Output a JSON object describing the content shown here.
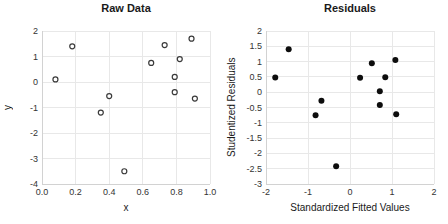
{
  "style": {
    "background": "#ffffff",
    "grid_color": "#e8e8e8",
    "axis_color": "#d2d2d2",
    "tick_color": "#333333",
    "text_color": "#1a1a1a",
    "open_marker_color": "#3a3a3a",
    "filled_marker_color": "#0d0d0d"
  },
  "chart_data": [
    {
      "type": "scatter",
      "title": "Raw Data",
      "xlabel": "x",
      "ylabel": "y",
      "xlim": [
        0.0,
        1.0
      ],
      "ylim": [
        -4,
        2
      ],
      "xticks": [
        "0.0",
        "0.2",
        "0.4",
        "0.6",
        "0.8",
        "1.0"
      ],
      "yticks": [
        "2",
        "1",
        "0",
        "-1",
        "-2",
        "-3",
        "-4"
      ],
      "grid": true,
      "legend": false,
      "marker": "open-circle",
      "points": [
        [
          0.08,
          0.1
        ],
        [
          0.18,
          1.4
        ],
        [
          0.35,
          -1.2
        ],
        [
          0.4,
          -0.55
        ],
        [
          0.49,
          -3.5
        ],
        [
          0.65,
          0.75
        ],
        [
          0.73,
          1.45
        ],
        [
          0.79,
          0.2
        ],
        [
          0.79,
          -0.4
        ],
        [
          0.82,
          0.9
        ],
        [
          0.89,
          1.7
        ],
        [
          0.91,
          -0.65
        ]
      ]
    },
    {
      "type": "scatter",
      "title": "Residuals",
      "xlabel": "Standardized Fitted Values",
      "ylabel": "Studentized Residuals",
      "xlim": [
        -2,
        2
      ],
      "ylim": [
        -3,
        2
      ],
      "xticks": [
        "-2",
        "-1",
        "0",
        "1",
        "2"
      ],
      "yticks": [
        "2",
        "1.5",
        "1",
        "0.5",
        "0",
        "-0.5",
        "-1",
        "-1.5",
        "-2",
        "-2.5",
        "-3"
      ],
      "grid": true,
      "legend": false,
      "marker": "filled-circle",
      "points": [
        [
          -1.78,
          0.48
        ],
        [
          -1.46,
          1.4
        ],
        [
          -0.82,
          -0.75
        ],
        [
          -0.68,
          -0.28
        ],
        [
          -0.33,
          -2.42
        ],
        [
          0.24,
          0.47
        ],
        [
          0.52,
          0.95
        ],
        [
          0.71,
          0.03
        ],
        [
          0.71,
          -0.42
        ],
        [
          0.84,
          0.49
        ],
        [
          1.08,
          1.05
        ],
        [
          1.1,
          -0.72
        ]
      ]
    }
  ]
}
